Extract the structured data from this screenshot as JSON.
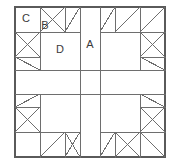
{
  "figure": {
    "type": "geometric-diagram",
    "symmetry": "4-fold rotational",
    "background_color": "#ffffff",
    "line_color": "#6e6e6e",
    "border_color": "#5a5a5a",
    "label_color": "#3a3a3a",
    "stroke_width": 1,
    "canvas": {
      "width": 180,
      "height": 167
    },
    "frame": {
      "x": 15,
      "y": 7,
      "width": 150,
      "height": 150
    },
    "grid": {
      "vertical_lines": [
        15,
        40,
        65,
        80,
        100,
        115,
        140,
        165
      ],
      "horizontal_lines": [
        7,
        32,
        57,
        70,
        94,
        107,
        132,
        157
      ],
      "center_band_x": [
        80,
        100
      ],
      "center_band_y": [
        70,
        94
      ]
    },
    "labels": [
      {
        "id": "A",
        "text": "A",
        "x": 90,
        "y": 45,
        "region": "center-vertical-strip"
      },
      {
        "id": "B",
        "text": "B",
        "x": 45,
        "y": 26,
        "region": "small-triangle-top"
      },
      {
        "id": "C",
        "text": "C",
        "x": 26,
        "y": 19,
        "region": "corner-square"
      },
      {
        "id": "D",
        "text": "D",
        "x": 60,
        "y": 50,
        "region": "large-inner-square"
      }
    ],
    "diagonals": [
      {
        "x1": 40,
        "y1": 32,
        "x2": 65,
        "y2": 7,
        "quadrant": "top-left"
      },
      {
        "x1": 40,
        "y1": 7,
        "x2": 65,
        "y2": 32,
        "quadrant": "top-left"
      },
      {
        "x1": 65,
        "y1": 32,
        "x2": 80,
        "y2": 7,
        "quadrant": "top-left"
      },
      {
        "x1": 15,
        "y1": 32,
        "x2": 40,
        "y2": 57,
        "quadrant": "left-top"
      },
      {
        "x1": 15,
        "y1": 57,
        "x2": 40,
        "y2": 32,
        "quadrant": "left-top"
      },
      {
        "x1": 15,
        "y1": 57,
        "x2": 40,
        "y2": 70,
        "quadrant": "left-top"
      },
      {
        "x1": 100,
        "y1": 32,
        "x2": 115,
        "y2": 7,
        "quadrant": "top-right"
      },
      {
        "x1": 115,
        "y1": 32,
        "x2": 140,
        "y2": 7,
        "quadrant": "top-right"
      },
      {
        "x1": 140,
        "y1": 32,
        "x2": 165,
        "y2": 7,
        "quadrant": "top-right"
      },
      {
        "x1": 140,
        "y1": 32,
        "x2": 165,
        "y2": 57,
        "quadrant": "right-top"
      },
      {
        "x1": 140,
        "y1": 57,
        "x2": 165,
        "y2": 32,
        "quadrant": "right-top"
      },
      {
        "x1": 140,
        "y1": 57,
        "x2": 165,
        "y2": 70,
        "quadrant": "right-top"
      },
      {
        "x1": 15,
        "y1": 107,
        "x2": 40,
        "y2": 94,
        "quadrant": "left-bottom"
      },
      {
        "x1": 15,
        "y1": 107,
        "x2": 40,
        "y2": 132,
        "quadrant": "left-bottom"
      },
      {
        "x1": 15,
        "y1": 132,
        "x2": 40,
        "y2": 107,
        "quadrant": "left-bottom"
      },
      {
        "x1": 40,
        "y1": 157,
        "x2": 65,
        "y2": 132,
        "quadrant": "bottom-left"
      },
      {
        "x1": 65,
        "y1": 157,
        "x2": 80,
        "y2": 132,
        "quadrant": "bottom-left"
      },
      {
        "x1": 65,
        "y1": 132,
        "x2": 80,
        "y2": 157,
        "quadrant": "bottom-left"
      },
      {
        "x1": 100,
        "y1": 157,
        "x2": 115,
        "y2": 132,
        "quadrant": "bottom-right"
      },
      {
        "x1": 115,
        "y1": 132,
        "x2": 140,
        "y2": 157,
        "quadrant": "bottom-right"
      },
      {
        "x1": 115,
        "y1": 157,
        "x2": 140,
        "y2": 132,
        "quadrant": "bottom-right"
      },
      {
        "x1": 140,
        "y1": 132,
        "x2": 165,
        "y2": 157,
        "quadrant": "bottom-right"
      },
      {
        "x1": 140,
        "y1": 94,
        "x2": 165,
        "y2": 107,
        "quadrant": "right-bottom"
      },
      {
        "x1": 140,
        "y1": 107,
        "x2": 165,
        "y2": 132,
        "quadrant": "right-bottom"
      },
      {
        "x1": 140,
        "y1": 132,
        "x2": 165,
        "y2": 107,
        "quadrant": "right-bottom"
      }
    ],
    "segments": [
      {
        "x1": 15,
        "y1": 7,
        "x2": 165,
        "y2": 7,
        "name": "outer-top"
      },
      {
        "x1": 15,
        "y1": 157,
        "x2": 165,
        "y2": 157,
        "name": "outer-bottom"
      },
      {
        "x1": 15,
        "y1": 7,
        "x2": 15,
        "y2": 157,
        "name": "outer-left"
      },
      {
        "x1": 165,
        "y1": 7,
        "x2": 165,
        "y2": 157,
        "name": "outer-right"
      },
      {
        "x1": 15,
        "y1": 32,
        "x2": 80,
        "y2": 32,
        "name": "h-top-left-inner"
      },
      {
        "x1": 100,
        "y1": 32,
        "x2": 165,
        "y2": 32,
        "name": "h-top-right-inner"
      },
      {
        "x1": 15,
        "y1": 132,
        "x2": 80,
        "y2": 132,
        "name": "h-bottom-left-inner"
      },
      {
        "x1": 100,
        "y1": 132,
        "x2": 165,
        "y2": 132,
        "name": "h-bottom-right-inner"
      },
      {
        "x1": 15,
        "y1": 57,
        "x2": 40,
        "y2": 57,
        "name": "h-left-tick-upper"
      },
      {
        "x1": 15,
        "y1": 107,
        "x2": 40,
        "y2": 107,
        "name": "h-left-tick-lower"
      },
      {
        "x1": 140,
        "y1": 57,
        "x2": 165,
        "y2": 57,
        "name": "h-right-tick-upper"
      },
      {
        "x1": 140,
        "y1": 107,
        "x2": 165,
        "y2": 107,
        "name": "h-right-tick-lower"
      },
      {
        "x1": 15,
        "y1": 70,
        "x2": 165,
        "y2": 70,
        "name": "h-center-band-top"
      },
      {
        "x1": 15,
        "y1": 94,
        "x2": 165,
        "y2": 94,
        "name": "h-center-band-bottom"
      },
      {
        "x1": 40,
        "y1": 7,
        "x2": 40,
        "y2": 70,
        "name": "v-left-inner-upper"
      },
      {
        "x1": 40,
        "y1": 94,
        "x2": 40,
        "y2": 157,
        "name": "v-left-inner-lower"
      },
      {
        "x1": 140,
        "y1": 7,
        "x2": 140,
        "y2": 70,
        "name": "v-right-inner-upper"
      },
      {
        "x1": 140,
        "y1": 94,
        "x2": 140,
        "y2": 157,
        "name": "v-right-inner-lower"
      },
      {
        "x1": 65,
        "y1": 7,
        "x2": 65,
        "y2": 32,
        "name": "v-top-left-tick"
      },
      {
        "x1": 115,
        "y1": 7,
        "x2": 115,
        "y2": 32,
        "name": "v-top-right-tick"
      },
      {
        "x1": 65,
        "y1": 132,
        "x2": 65,
        "y2": 157,
        "name": "v-bottom-left-tick"
      },
      {
        "x1": 115,
        "y1": 132,
        "x2": 115,
        "y2": 157,
        "name": "v-bottom-right-tick"
      },
      {
        "x1": 80,
        "y1": 7,
        "x2": 80,
        "y2": 157,
        "name": "v-center-band-left"
      },
      {
        "x1": 100,
        "y1": 7,
        "x2": 100,
        "y2": 157,
        "name": "v-center-band-right"
      }
    ]
  }
}
